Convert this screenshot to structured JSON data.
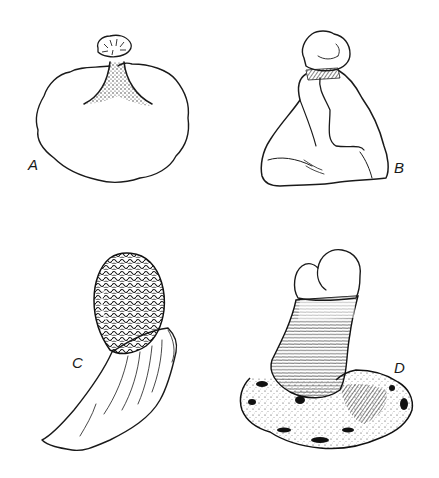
{
  "plate": {
    "background": "#ffffff",
    "ink_color": "#1a1a1a",
    "figures": [
      {
        "id": "A",
        "label": "A",
        "description": "broad irregular stippled cup-shaped base with narrow dark stalk topped by small radially ridged cap"
      },
      {
        "id": "B",
        "label": "B",
        "description": "smooth lobed conical body with small rounded lumpy cap atop a finely striated collar"
      },
      {
        "id": "C",
        "label": "C",
        "description": "densely wrinkled reticulate oval head on a curved tapering striated stalk"
      },
      {
        "id": "D",
        "label": "D",
        "description": "bilobed rounded cap over a horizontally banded stalk rising from a spreading dark-mottled base"
      }
    ]
  }
}
